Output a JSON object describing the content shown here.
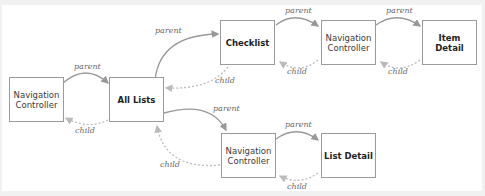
{
  "diagram": {
    "nodes": [
      {
        "id": "nav1",
        "label": "Navigation Controller",
        "bold": false
      },
      {
        "id": "alllists",
        "label": "All Lists",
        "bold": true
      },
      {
        "id": "checklist",
        "label": "Checklist",
        "bold": true
      },
      {
        "id": "nav2",
        "label": "Navigation Controller",
        "bold": false
      },
      {
        "id": "itemdetail",
        "label": "Item Detail",
        "bold": true
      },
      {
        "id": "nav3",
        "label": "Navigation Controller",
        "bold": false
      },
      {
        "id": "listdetail",
        "label": "List Detail",
        "bold": true
      }
    ],
    "edges": [
      {
        "from": "nav1",
        "to": "alllists",
        "label": "parent",
        "style": "solid"
      },
      {
        "from": "alllists",
        "to": "nav1",
        "label": "child",
        "style": "dotted"
      },
      {
        "from": "alllists",
        "to": "checklist",
        "label": "parent",
        "style": "solid"
      },
      {
        "from": "checklist",
        "to": "alllists",
        "label": "child",
        "style": "dotted"
      },
      {
        "from": "checklist",
        "to": "nav2",
        "label": "parent",
        "style": "solid"
      },
      {
        "from": "nav2",
        "to": "checklist",
        "label": "child",
        "style": "dotted"
      },
      {
        "from": "nav2",
        "to": "itemdetail",
        "label": "parent",
        "style": "solid"
      },
      {
        "from": "itemdetail",
        "to": "nav2",
        "label": "child",
        "style": "dotted"
      },
      {
        "from": "alllists",
        "to": "nav3",
        "label": "parent",
        "style": "solid"
      },
      {
        "from": "nav3",
        "to": "alllists",
        "label": "child",
        "style": "dotted"
      },
      {
        "from": "nav3",
        "to": "listdetail",
        "label": "parent",
        "style": "solid"
      },
      {
        "from": "listdetail",
        "to": "nav3",
        "label": "child",
        "style": "dotted"
      }
    ],
    "labels": {
      "nav1_line1": "Navigation",
      "nav1_line2": "Controller",
      "alllists": "All Lists",
      "checklist": "Checklist",
      "nav2_line1": "Navigation",
      "nav2_line2": "Controller",
      "itemdetail_line1": "Item",
      "itemdetail_line2": "Detail",
      "nav3_line1": "Navigation",
      "nav3_line2": "Controller",
      "listdetail": "List Detail",
      "parent": "parent",
      "child": "child"
    }
  }
}
